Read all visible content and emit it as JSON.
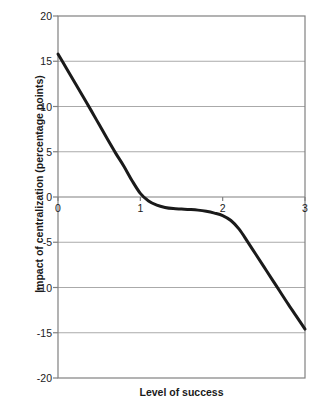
{
  "chart_data": {
    "type": "line",
    "title": "",
    "xlabel": "Level of success",
    "ylabel": "Impact of centralization (percentage points)",
    "xlim": [
      0,
      3
    ],
    "ylim": [
      -20,
      20
    ],
    "xticks": [
      "0",
      "1",
      "2",
      "3"
    ],
    "xtick_values": [
      0,
      1,
      2,
      3
    ],
    "yticks": [
      "20",
      "15",
      "10",
      "5",
      "0",
      "-5",
      "-10",
      "-15",
      "-20"
    ],
    "ytick_values": [
      20,
      15,
      10,
      5,
      0,
      -5,
      -10,
      -15,
      -20
    ],
    "grid": "horizontal",
    "legend": "none",
    "series": [
      {
        "name": "Impact of centralization",
        "color": "#1a1a1a",
        "x": [
          0.0,
          0.1,
          0.2,
          0.3,
          0.4,
          0.5,
          0.6,
          0.7,
          0.8,
          0.9,
          1.0,
          1.1,
          1.2,
          1.3,
          1.4,
          1.5,
          1.6,
          1.7,
          1.8,
          1.9,
          2.0,
          2.1,
          2.2,
          2.3,
          2.4,
          2.5,
          2.6,
          2.7,
          2.8,
          2.9,
          3.0
        ],
        "y": [
          15.8,
          14.25,
          12.7,
          11.15,
          9.6,
          8.0,
          6.4,
          4.85,
          3.4,
          1.8,
          0.4,
          -0.45,
          -0.9,
          -1.15,
          -1.28,
          -1.33,
          -1.38,
          -1.45,
          -1.58,
          -1.78,
          -2.05,
          -2.6,
          -3.55,
          -4.9,
          -6.3,
          -7.7,
          -9.1,
          -10.5,
          -11.9,
          -13.25,
          -14.6
        ]
      }
    ]
  },
  "plot": {
    "border_color": "#808080",
    "gridline_color": "#aaaaaa",
    "background": "#ffffff"
  }
}
